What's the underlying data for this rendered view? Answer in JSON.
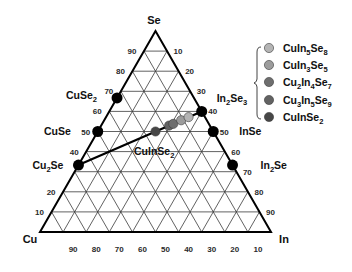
{
  "chart_data": {
    "type": "ternary",
    "title": "",
    "vertices": {
      "top": "Se",
      "left": "Cu",
      "right": "In"
    },
    "grid": true,
    "divisions": 10,
    "axes": {
      "left": {
        "component": "Se",
        "ticks": [
          10,
          20,
          30,
          40,
          50,
          60,
          70,
          80,
          90
        ],
        "shown": [
          10,
          20,
          40,
          50,
          60,
          70,
          80,
          90
        ]
      },
      "right": {
        "component": "In",
        "ticks": [
          10,
          20,
          30,
          40,
          50,
          60,
          70,
          80,
          90
        ],
        "shown": [
          10,
          20,
          30,
          40,
          50,
          60,
          70,
          80,
          90
        ]
      },
      "bottom": {
        "component": "Cu",
        "ticks": [
          90,
          80,
          70,
          60,
          50,
          40,
          30,
          20,
          10
        ],
        "shown": [
          90,
          80,
          70,
          60,
          50,
          40,
          30,
          20,
          10
        ]
      }
    },
    "binary_phases": [
      {
        "name": "CuSe2",
        "Cu": 33.3,
        "In": 0,
        "Se": 66.7,
        "color": "#000000"
      },
      {
        "name": "CuSe",
        "Cu": 50.0,
        "In": 0,
        "Se": 50.0,
        "color": "#000000"
      },
      {
        "name": "Cu2Se",
        "Cu": 66.7,
        "In": 0,
        "Se": 33.3,
        "color": "#000000"
      },
      {
        "name": "In2Se3",
        "Cu": 0,
        "In": 40.0,
        "Se": 60.0,
        "color": "#000000"
      },
      {
        "name": "InSe",
        "Cu": 0,
        "In": 50.0,
        "Se": 50.0,
        "color": "#000000"
      },
      {
        "name": "In2Se",
        "Cu": 0,
        "In": 66.7,
        "Se": 33.3,
        "color": "#000000"
      }
    ],
    "tie_line": {
      "from": "Cu2Se",
      "to": "In2Se3"
    },
    "ternary_compounds": [
      {
        "name": "CuIn5Se8",
        "Cu": 7.1,
        "In": 35.7,
        "Se": 57.1,
        "color": "#b4b4b4"
      },
      {
        "name": "CuIn3Se5",
        "Cu": 11.1,
        "In": 33.3,
        "Se": 55.6,
        "color": "#9c9c9c"
      },
      {
        "name": "Cu2In4Se7",
        "Cu": 15.4,
        "In": 30.8,
        "Se": 53.8,
        "color": "#6e6e6e"
      },
      {
        "name": "Cu3In5Se9",
        "Cu": 17.6,
        "In": 29.4,
        "Se": 52.9,
        "color": "#626262"
      },
      {
        "name": "CuInSe2",
        "Cu": 25.0,
        "In": 25.0,
        "Se": 50.0,
        "color": "#474747"
      }
    ],
    "annotation": {
      "text": "CuInSe2"
    },
    "legend": {
      "position": "upper-right",
      "grouped_with_brace": true,
      "entries": [
        {
          "label": "CuIn5Se8",
          "color": "#b4b4b4"
        },
        {
          "label": "CuIn3Se5",
          "color": "#9c9c9c"
        },
        {
          "label": "Cu2In4Se7",
          "color": "#6e6e6e"
        },
        {
          "label": "Cu3In5Se9",
          "color": "#626262"
        },
        {
          "label": "CuInSe2",
          "color": "#474747"
        }
      ]
    }
  }
}
